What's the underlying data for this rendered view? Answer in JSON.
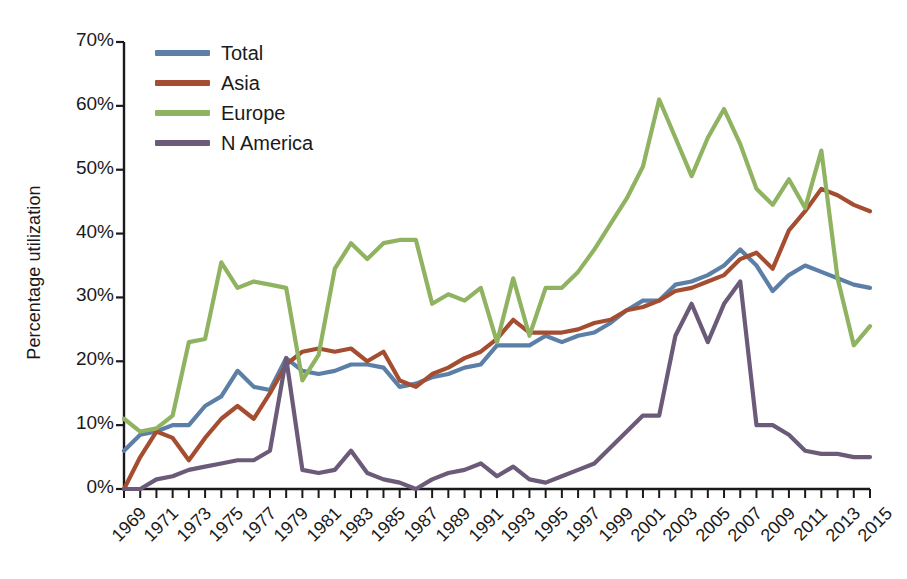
{
  "chart_data": {
    "type": "line",
    "title": "",
    "xlabel": "",
    "ylabel": "Percentage utilization",
    "ylim": [
      0,
      70
    ],
    "xlim": [
      1969,
      2015
    ],
    "ytick_labels": [
      "0%",
      "10%",
      "20%",
      "30%",
      "40%",
      "50%",
      "60%",
      "70%"
    ],
    "ytick_values": [
      0,
      10,
      20,
      30,
      40,
      50,
      60,
      70
    ],
    "xtick_labels": [
      "1969",
      "1971",
      "1973",
      "1975",
      "1977",
      "1979",
      "1981",
      "1983",
      "1985",
      "1987",
      "1989",
      "1991",
      "1993",
      "1995",
      "1997",
      "1999",
      "2001",
      "2003",
      "2005",
      "2007",
      "2009",
      "2011",
      "2013",
      "2015"
    ],
    "xtick_values": [
      1969,
      1971,
      1973,
      1975,
      1977,
      1979,
      1981,
      1983,
      1985,
      1987,
      1989,
      1991,
      1993,
      1995,
      1997,
      1999,
      2001,
      2003,
      2005,
      2007,
      2009,
      2011,
      2013,
      2015
    ],
    "minor_ticks_every": 1,
    "grid": false,
    "legend_position": "top-left-inside",
    "x": [
      1969,
      1970,
      1971,
      1972,
      1973,
      1974,
      1975,
      1976,
      1977,
      1978,
      1979,
      1980,
      1981,
      1982,
      1983,
      1984,
      1985,
      1986,
      1987,
      1988,
      1989,
      1990,
      1991,
      1992,
      1993,
      1994,
      1995,
      1996,
      1997,
      1998,
      1999,
      2000,
      2001,
      2002,
      2003,
      2004,
      2005,
      2006,
      2007,
      2008,
      2009,
      2010,
      2011,
      2012,
      2013,
      2014,
      2015
    ],
    "series": [
      {
        "name": "Total",
        "color": "#5b7fa6",
        "values": [
          6.0,
          8.5,
          9.0,
          10.0,
          10.0,
          13.0,
          14.5,
          18.5,
          16.0,
          15.5,
          20.5,
          18.5,
          18.0,
          18.5,
          19.5,
          19.5,
          19.0,
          16.0,
          16.5,
          17.5,
          18.0,
          19.0,
          19.5,
          22.5,
          22.5,
          22.5,
          24.0,
          23.0,
          24.0,
          24.5,
          26.0,
          28.0,
          29.5,
          29.5,
          32.0,
          32.5,
          33.5,
          35.0,
          37.5,
          35.0,
          31.0,
          33.5,
          35.0,
          34.0,
          33.0,
          32.0,
          31.5
        ]
      },
      {
        "name": "Asia",
        "color": "#a44d31",
        "values": [
          0.0,
          5.0,
          9.0,
          8.0,
          4.5,
          8.0,
          11.0,
          13.0,
          11.0,
          15.0,
          19.5,
          21.5,
          22.0,
          21.5,
          22.0,
          20.0,
          21.5,
          17.0,
          16.0,
          18.0,
          19.0,
          20.5,
          21.5,
          23.5,
          26.5,
          24.5,
          24.5,
          24.5,
          25.0,
          26.0,
          26.5,
          28.0,
          28.5,
          29.5,
          31.0,
          31.5,
          32.5,
          33.5,
          36.0,
          37.0,
          34.5,
          40.5,
          43.5,
          47.0,
          46.0,
          44.5,
          43.5
        ]
      },
      {
        "name": "Europe",
        "color": "#8fb360",
        "values": [
          11.0,
          9.0,
          9.5,
          11.5,
          23.0,
          23.5,
          35.5,
          31.5,
          32.5,
          32.0,
          31.5,
          17.0,
          21.0,
          34.5,
          38.5,
          36.0,
          38.5,
          39.0,
          39.0,
          29.0,
          30.5,
          29.5,
          31.5,
          23.0,
          33.0,
          24.0,
          31.5,
          31.5,
          34.0,
          37.5,
          41.5,
          45.5,
          50.5,
          61.0,
          55.0,
          49.0,
          55.0,
          59.5,
          54.0,
          47.0,
          44.5,
          48.5,
          44.0,
          53.0,
          33.0,
          22.5,
          25.5
        ]
      },
      {
        "name": "N America",
        "color": "#6b5b78",
        "values": [
          0.0,
          0.0,
          1.5,
          2.0,
          3.0,
          3.5,
          4.0,
          4.5,
          4.5,
          6.0,
          20.5,
          3.0,
          2.5,
          3.0,
          6.0,
          2.5,
          1.5,
          1.0,
          0.0,
          1.5,
          2.5,
          3.0,
          4.0,
          2.0,
          3.5,
          1.5,
          1.0,
          2.0,
          3.0,
          4.0,
          6.5,
          9.0,
          11.5,
          11.5,
          24.0,
          29.0,
          23.0,
          29.0,
          32.5,
          10.0,
          10.0,
          8.5,
          6.0,
          5.5,
          5.5,
          5.0,
          5.0
        ]
      }
    ]
  },
  "legend": {
    "items": [
      {
        "label": "Total",
        "color": "#5b7fa6"
      },
      {
        "label": "Asia",
        "color": "#a44d31"
      },
      {
        "label": "Europe",
        "color": "#8fb360"
      },
      {
        "label": "N America",
        "color": "#6b5b78"
      }
    ]
  }
}
